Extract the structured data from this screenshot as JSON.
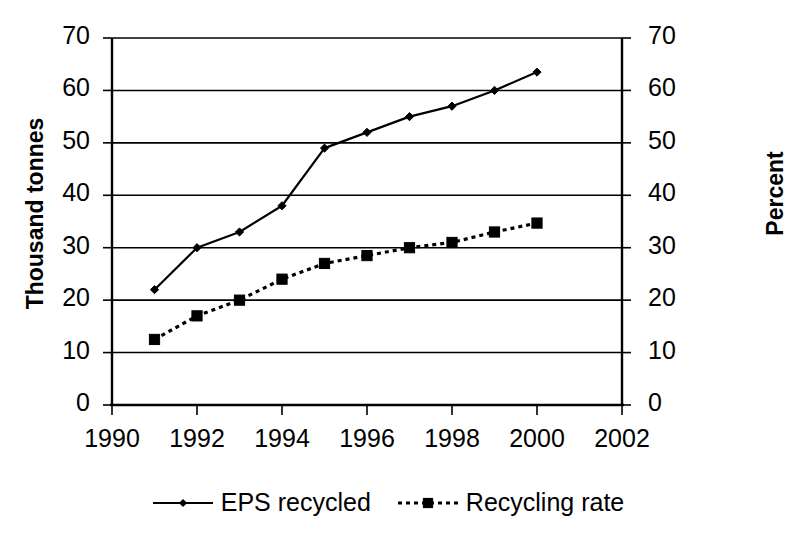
{
  "chart_data": {
    "type": "line",
    "title": "",
    "subtitle": "",
    "xlabel": "",
    "ylabel": "Thousand tonnes",
    "y2label": "Percent",
    "x": [
      1991,
      1992,
      1993,
      1994,
      1995,
      1996,
      1997,
      1998,
      1999,
      2000
    ],
    "xlim": [
      1990,
      2002
    ],
    "ylim": [
      0,
      70
    ],
    "y2lim": [
      0,
      70
    ],
    "xticks": [
      "1990",
      "1992",
      "1994",
      "1996",
      "1998",
      "2000",
      "2002"
    ],
    "xtick_values": [
      1990,
      1992,
      1994,
      1996,
      1998,
      2000,
      2002
    ],
    "yticks": [
      "0",
      "10",
      "20",
      "30",
      "40",
      "50",
      "60",
      "70"
    ],
    "ytick_values": [
      0,
      10,
      20,
      30,
      40,
      50,
      60,
      70
    ],
    "y2ticks": [
      "0",
      "10",
      "20",
      "30",
      "40",
      "50",
      "60",
      "70"
    ],
    "y2tick_values": [
      0,
      10,
      20,
      30,
      40,
      50,
      60,
      70
    ],
    "grid": "horizontal",
    "legend_position": "bottom-center",
    "series": [
      {
        "name": "EPS recycled",
        "axis": "left",
        "units": "thousand tonnes",
        "linestyle": "solid",
        "marker": "diamond",
        "color": "#000000",
        "values": [
          22,
          30,
          33,
          38,
          49,
          52,
          55,
          57,
          60,
          63.5
        ]
      },
      {
        "name": "Recycling rate",
        "axis": "right",
        "units": "percent",
        "linestyle": "dotted",
        "marker": "square",
        "color": "#000000",
        "values": [
          12.5,
          17,
          20,
          24,
          27,
          28.5,
          30,
          31,
          33,
          34.7
        ]
      }
    ]
  },
  "legend": {
    "entries": [
      {
        "label": "EPS recycled",
        "marker": "diamond-marker",
        "linestyle": "solid"
      },
      {
        "label": "Recycling rate",
        "marker": "square-marker",
        "linestyle": "dotted"
      }
    ]
  },
  "axes": {
    "left_title": "Thousand tonnes",
    "right_title": "Percent"
  },
  "colors": {
    "foreground": "#000000",
    "background": "#ffffff",
    "gridline": "#000000"
  }
}
